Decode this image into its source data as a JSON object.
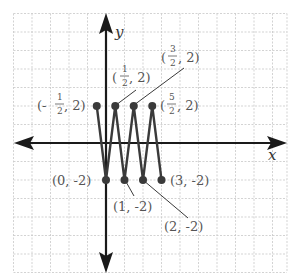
{
  "axes": {
    "x_label": "x",
    "y_label": "y"
  },
  "labels": {
    "p1": {
      "open": "(-",
      "num": "1",
      "den": "2",
      "close": ", 2)"
    },
    "p2": {
      "open": "(",
      "num": "1",
      "den": "2",
      "close": ", 2)"
    },
    "p3": {
      "open": "(",
      "num": "3",
      "den": "2",
      "close": ", 2)"
    },
    "p4": {
      "open": "(",
      "num": "5",
      "den": "2",
      "close": ", 2)"
    },
    "p5": "(0, -2)",
    "p6": "(1, -2)",
    "p7": "(2, -2)",
    "p8": "(3, -2)"
  },
  "chart_data": {
    "type": "line",
    "title": "",
    "xlabel": "x",
    "ylabel": "y",
    "grid": true,
    "unit_px": 18.5,
    "xlim": [
      -5,
      9.8
    ],
    "ylim": [
      -7,
      7
    ],
    "series": [
      {
        "name": "zigzag",
        "points": [
          {
            "x": -0.5,
            "y": 2,
            "label": "(-1/2, 2)"
          },
          {
            "x": 0,
            "y": -2,
            "label": "(0, -2)"
          },
          {
            "x": 0.5,
            "y": 2,
            "label": "(1/2, 2)"
          },
          {
            "x": 1,
            "y": -2,
            "label": "(1, -2)"
          },
          {
            "x": 1.5,
            "y": 2,
            "label": "(3/2, 2)"
          },
          {
            "x": 2,
            "y": -2,
            "label": "(2, -2)"
          },
          {
            "x": 2.5,
            "y": 2,
            "label": "(5/2, 2)"
          },
          {
            "x": 3,
            "y": -2,
            "label": "(3, -2)"
          }
        ]
      }
    ]
  }
}
